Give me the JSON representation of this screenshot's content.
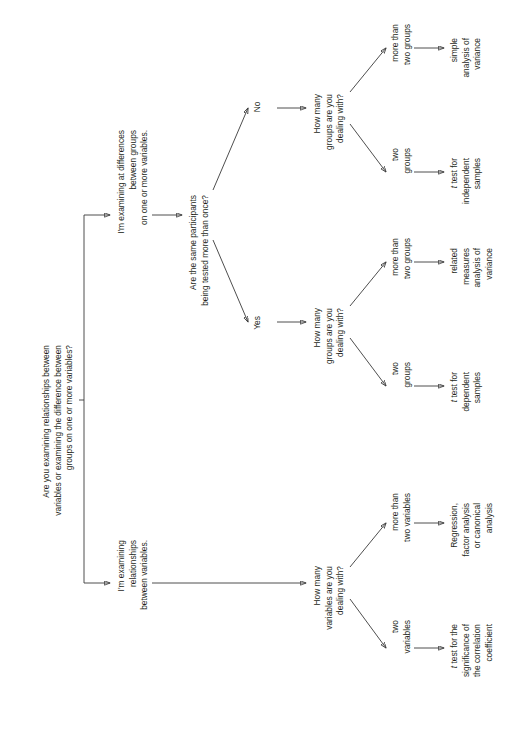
{
  "figure": {
    "type": "decision-flowchart",
    "orientation": "rotated-90-counterclockwise",
    "background_color": "#ffffff",
    "text_color": "#231f20",
    "line_color": "#3a3a3a"
  },
  "nodes": {
    "root_question": "Are you examining relationships between\nvariables or examining the difference between\ngroups on one or more variables?",
    "branch_differences": "I'm examining at differences\nbetween groups\non one or more variables.",
    "branch_relationships": "I'm examining\nrelationships\nbetween variables.",
    "q_repeated": "Are the same participants\nbeing tested more than once?",
    "label_no": "No",
    "label_yes": "Yes",
    "q_groups_no": "How many\ngroups are you\ndealing with?",
    "q_groups_yes": "How many\ngroups are you\ndealing with?",
    "q_variables": "How many\nvariables are you\ndealing with?",
    "opt_no_more_groups": "more than\ntwo groups",
    "opt_no_two_groups": "two\ngroups",
    "opt_yes_more_groups": "more than\ntwo groups",
    "opt_yes_two_groups": "two\ngroups",
    "opt_more_variables": "more than\ntwo variables",
    "opt_two_variables": "two\nvariables",
    "result_simple_anova": "simple\nanalysis of\nvariance",
    "result_t_independent_italic": "t",
    "result_t_independent": " test for\nindependent\nsamples",
    "result_related_anova": "related\nmeasures\nanalysis of\nvariance",
    "result_t_dependent_italic": "t",
    "result_t_dependent": " test for\ndependent\nsamples",
    "result_regression": "Regression,\nfactor analysis\nor canonical\nanalysis",
    "result_t_correlation_italic": "t",
    "result_t_correlation": " test for the\nsignificance of\nthe correlation\ncoefficient"
  }
}
